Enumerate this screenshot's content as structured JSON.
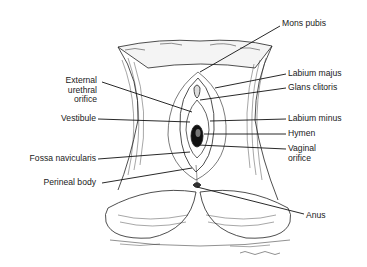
{
  "diagram": {
    "type": "anatomical-illustration",
    "style": "black-and-white line engraving",
    "signature": "J. V. Schaubert (artist signature, illegible)",
    "labels_left": [
      {
        "id": "external-urethral-orifice",
        "text": "External\nurethral\norifice"
      },
      {
        "id": "vestibule",
        "text": "Vestibule"
      },
      {
        "id": "fossa-navicularis",
        "text": "Fossa navicularis"
      },
      {
        "id": "perineal-body",
        "text": "Perineal body"
      }
    ],
    "labels_right": [
      {
        "id": "mons-pubis",
        "text": "Mons pubis"
      },
      {
        "id": "labium-majus",
        "text": "Labium majus"
      },
      {
        "id": "glans-clitoris",
        "text": "Glans clitoris"
      },
      {
        "id": "labium-minus",
        "text": "Labium minus"
      },
      {
        "id": "hymen",
        "text": "Hymen"
      },
      {
        "id": "vaginal-orifice",
        "text": "Vaginal\norifice"
      },
      {
        "id": "anus",
        "text": "Anus"
      }
    ]
  }
}
